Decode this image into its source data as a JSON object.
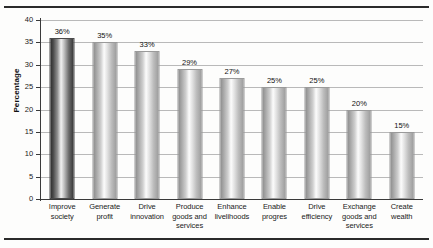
{
  "figure": {
    "top_rule": "horizontal-rule",
    "bottom_rule": "horizontal-rule"
  },
  "chart_data": {
    "type": "bar",
    "title": "",
    "xlabel": "",
    "ylabel": "Percentage",
    "ylim": [
      0,
      40
    ],
    "ytick_step": 5,
    "yticks": [
      "0",
      "5",
      "10",
      "15",
      "20",
      "25",
      "30",
      "35",
      "40"
    ],
    "grid": true,
    "grid_axis": "y",
    "legend": false,
    "legend_position": "none",
    "highlight_index": 0,
    "categories": [
      "Improve society",
      "Generate profit",
      "Drive innovation",
      "Produce goods and services",
      "Enhance livelihoods",
      "Enable progres",
      "Drive efficiency",
      "Exchange goods and services",
      "Create wealth"
    ],
    "category_lines": [
      [
        "Improve",
        "society"
      ],
      [
        "Generate",
        "profit"
      ],
      [
        "Drive",
        "innovation"
      ],
      [
        "Produce",
        "goods and",
        "services"
      ],
      [
        "Enhance",
        "livelihoods"
      ],
      [
        "Enable",
        "progres"
      ],
      [
        "Drive",
        "efficiency"
      ],
      [
        "Exchange",
        "goods and",
        "services"
      ],
      [
        "Create",
        "wealth"
      ]
    ],
    "values": [
      36,
      35,
      33,
      29,
      27,
      25,
      25,
      20,
      15
    ],
    "data_labels": [
      "36%",
      "35%",
      "33%",
      "29%",
      "27%",
      "25%",
      "25%",
      "20%",
      "15%"
    ]
  },
  "colors": {
    "bar_fill_light": "#cfcfcf",
    "bar_fill_dark": "#4b4b4b",
    "bar_border": "#9a9a9a",
    "gridline": "#b9b9b9",
    "axis": "#3a3a3a",
    "rule": "#2b2b2b",
    "text": "#1a1a1a",
    "background": "#fdfdfc"
  }
}
